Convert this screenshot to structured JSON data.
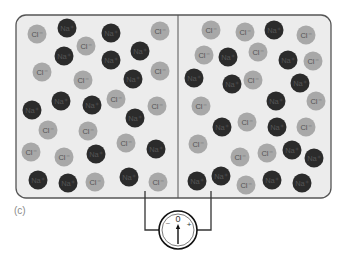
{
  "figure": {
    "panel_label": "(c)",
    "colors": {
      "background": "#ffffff",
      "container_fill": "#ececec",
      "container_stroke": "#555555",
      "na_fill": "#2b2b2b",
      "na_text": "#555555",
      "cl_fill": "#a8a8a8",
      "cl_text": "#555555",
      "wire": "#333333"
    },
    "container": {
      "x": 16,
      "y": 15,
      "w": 315,
      "h": 183,
      "radius": 10,
      "divider_x": 178
    },
    "ion_radius": 9.5,
    "ion_types": {
      "na": {
        "label": "Na+",
        "display": "Na⁺"
      },
      "cl": {
        "label": "Cl-",
        "display": "Cl⁻"
      }
    },
    "left_chamber": {
      "name": "left-compartment",
      "ions": [
        {
          "t": "cl",
          "x": 37,
          "y": 34
        },
        {
          "t": "na",
          "x": 67,
          "y": 28
        },
        {
          "t": "na",
          "x": 111,
          "y": 33
        },
        {
          "t": "cl",
          "x": 160,
          "y": 31
        },
        {
          "t": "cl",
          "x": 86,
          "y": 46
        },
        {
          "t": "na",
          "x": 140,
          "y": 51
        },
        {
          "t": "na",
          "x": 64,
          "y": 56
        },
        {
          "t": "na",
          "x": 111,
          "y": 60
        },
        {
          "t": "cl",
          "x": 42,
          "y": 72
        },
        {
          "t": "cl",
          "x": 83,
          "y": 80
        },
        {
          "t": "na",
          "x": 133,
          "y": 79
        },
        {
          "t": "cl",
          "x": 160,
          "y": 71
        },
        {
          "t": "na",
          "x": 32,
          "y": 110
        },
        {
          "t": "na",
          "x": 61,
          "y": 101
        },
        {
          "t": "na",
          "x": 92,
          "y": 105
        },
        {
          "t": "cl",
          "x": 116,
          "y": 99
        },
        {
          "t": "na",
          "x": 135,
          "y": 118
        },
        {
          "t": "cl",
          "x": 157,
          "y": 106
        },
        {
          "t": "cl",
          "x": 48,
          "y": 130
        },
        {
          "t": "cl",
          "x": 88,
          "y": 131
        },
        {
          "t": "cl",
          "x": 126,
          "y": 143
        },
        {
          "t": "na",
          "x": 156,
          "y": 149
        },
        {
          "t": "cl",
          "x": 31,
          "y": 152
        },
        {
          "t": "cl",
          "x": 64,
          "y": 157
        },
        {
          "t": "na",
          "x": 96,
          "y": 154
        },
        {
          "t": "na",
          "x": 38,
          "y": 180
        },
        {
          "t": "na",
          "x": 68,
          "y": 183
        },
        {
          "t": "cl",
          "x": 95,
          "y": 182
        },
        {
          "t": "na",
          "x": 129,
          "y": 177
        },
        {
          "t": "cl",
          "x": 158,
          "y": 182
        }
      ]
    },
    "right_chamber": {
      "name": "right-compartment",
      "ions": [
        {
          "t": "cl",
          "x": 211,
          "y": 30
        },
        {
          "t": "cl",
          "x": 245,
          "y": 32
        },
        {
          "t": "na",
          "x": 274,
          "y": 30
        },
        {
          "t": "cl",
          "x": 306,
          "y": 35
        },
        {
          "t": "cl",
          "x": 204,
          "y": 55
        },
        {
          "t": "na",
          "x": 228,
          "y": 57
        },
        {
          "t": "cl",
          "x": 258,
          "y": 52
        },
        {
          "t": "na",
          "x": 288,
          "y": 60
        },
        {
          "t": "cl",
          "x": 313,
          "y": 61
        },
        {
          "t": "na",
          "x": 194,
          "y": 78
        },
        {
          "t": "na",
          "x": 232,
          "y": 84
        },
        {
          "t": "cl",
          "x": 253,
          "y": 80
        },
        {
          "t": "na",
          "x": 300,
          "y": 83
        },
        {
          "t": "cl",
          "x": 201,
          "y": 106
        },
        {
          "t": "na",
          "x": 276,
          "y": 101
        },
        {
          "t": "cl",
          "x": 316,
          "y": 101
        },
        {
          "t": "na",
          "x": 222,
          "y": 127
        },
        {
          "t": "cl",
          "x": 247,
          "y": 122
        },
        {
          "t": "na",
          "x": 277,
          "y": 127
        },
        {
          "t": "cl",
          "x": 306,
          "y": 127
        },
        {
          "t": "cl",
          "x": 198,
          "y": 144
        },
        {
          "t": "cl",
          "x": 240,
          "y": 157
        },
        {
          "t": "cl",
          "x": 267,
          "y": 153
        },
        {
          "t": "na",
          "x": 292,
          "y": 150
        },
        {
          "t": "na",
          "x": 314,
          "y": 158
        },
        {
          "t": "na",
          "x": 197,
          "y": 181
        },
        {
          "t": "na",
          "x": 221,
          "y": 176
        },
        {
          "t": "cl",
          "x": 246,
          "y": 185
        },
        {
          "t": "na",
          "x": 272,
          "y": 180
        },
        {
          "t": "na",
          "x": 302,
          "y": 183
        }
      ]
    },
    "meter": {
      "name": "voltmeter",
      "cx": 178,
      "cy": 230,
      "r": 19,
      "zero_label": "0",
      "minus_label": "−",
      "plus_label": "+",
      "reading": "0",
      "left_probe_x": 145,
      "right_probe_x": 211,
      "probe_top_y": 191,
      "wire_y": 222
    }
  }
}
